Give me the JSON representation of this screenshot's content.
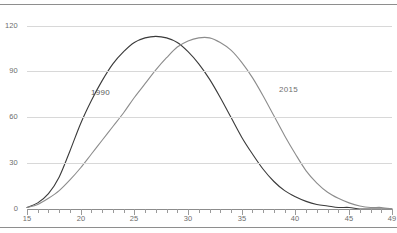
{
  "chart_data": {
    "type": "line",
    "title": "",
    "subtitle": "",
    "xlabel": "",
    "ylabel": "",
    "xlim": [
      15,
      49
    ],
    "ylim": [
      0,
      125
    ],
    "grid": true,
    "legend_position": "inline-annotation",
    "y_ticks": [
      0,
      30,
      60,
      90,
      120
    ],
    "x_ticks": [
      15,
      20,
      25,
      30,
      35,
      40,
      45,
      49
    ],
    "x_tick_step_minor": 1,
    "series": [
      {
        "name": "1990",
        "color": "#3a3a3a",
        "label_x": 21,
        "label_y": 76,
        "x": [
          15,
          16,
          17,
          18,
          19,
          20,
          21,
          22,
          23,
          24,
          25,
          26,
          27,
          28,
          29,
          30,
          31,
          32,
          33,
          34,
          35,
          36,
          37,
          38,
          39,
          40,
          41,
          42,
          43,
          44,
          45,
          46,
          47,
          48,
          49
        ],
        "values": [
          1,
          4,
          10,
          21,
          38,
          56,
          71,
          84,
          95,
          103,
          109,
          112,
          113,
          112,
          109,
          103,
          95,
          85,
          73,
          60,
          47,
          36,
          26,
          18,
          12,
          8,
          5,
          3,
          2,
          1,
          1,
          0,
          0,
          0,
          0
        ]
      },
      {
        "name": "2015",
        "color": "#8c8c8c",
        "label_x": 38.5,
        "label_y": 78,
        "x": [
          15,
          16,
          17,
          18,
          19,
          20,
          21,
          22,
          23,
          24,
          25,
          26,
          27,
          28,
          29,
          30,
          31,
          32,
          33,
          34,
          35,
          36,
          37,
          38,
          39,
          40,
          41,
          42,
          43,
          44,
          45,
          46,
          47,
          48,
          49
        ],
        "values": [
          1,
          3,
          7,
          12,
          19,
          27,
          36,
          45,
          54,
          63,
          73,
          82,
          91,
          99,
          106,
          110,
          112,
          112,
          109,
          104,
          96,
          86,
          74,
          61,
          48,
          36,
          25,
          17,
          11,
          7,
          4,
          2,
          1,
          1,
          0
        ]
      }
    ]
  },
  "axis": {
    "y_tick_labels": [
      "0",
      "30",
      "60",
      "90",
      "120"
    ],
    "x_tick_labels": [
      "15",
      "20",
      "25",
      "30",
      "35",
      "40",
      "45",
      "49"
    ]
  },
  "annotations": {
    "series_1_label": "1990",
    "series_2_label": "2015"
  }
}
